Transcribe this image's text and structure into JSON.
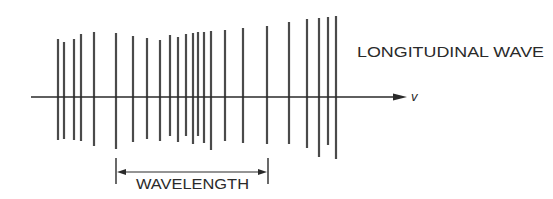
{
  "title": "LONGITUDINAL WAVE",
  "velocity_label": "v",
  "wavelength_label": "WAVELENGTH",
  "colors": {
    "line": "#4a4a4a",
    "axis": "#2a2a2a",
    "text": "#2a2a2a",
    "background": "#ffffff"
  },
  "axis": {
    "x1": 31,
    "x2": 407,
    "y": 97
  },
  "wavelength_bracket": {
    "x1": 116,
    "x2": 268,
    "y": 172,
    "tick_top": 158,
    "tick_bottom": 184
  },
  "compression_lines": [
    {
      "x": 58,
      "top": 39,
      "bottom": 140
    },
    {
      "x": 64,
      "top": 42,
      "bottom": 139
    },
    {
      "x": 74,
      "top": 39,
      "bottom": 140
    },
    {
      "x": 81,
      "top": 34,
      "bottom": 141
    },
    {
      "x": 94,
      "top": 32,
      "bottom": 146
    },
    {
      "x": 116,
      "top": 33,
      "bottom": 149
    },
    {
      "x": 133,
      "top": 36,
      "bottom": 142
    },
    {
      "x": 147,
      "top": 38,
      "bottom": 139
    },
    {
      "x": 160,
      "top": 40,
      "bottom": 141
    },
    {
      "x": 170,
      "top": 35,
      "bottom": 136
    },
    {
      "x": 178,
      "top": 37,
      "bottom": 142
    },
    {
      "x": 186,
      "top": 34,
      "bottom": 136
    },
    {
      "x": 193,
      "top": 33,
      "bottom": 144
    },
    {
      "x": 198,
      "top": 32,
      "bottom": 136
    },
    {
      "x": 204,
      "top": 32,
      "bottom": 143
    },
    {
      "x": 211,
      "top": 31,
      "bottom": 150
    },
    {
      "x": 225,
      "top": 30,
      "bottom": 141
    },
    {
      "x": 243,
      "top": 28,
      "bottom": 143
    },
    {
      "x": 267,
      "top": 26,
      "bottom": 144
    },
    {
      "x": 289,
      "top": 22,
      "bottom": 144
    },
    {
      "x": 307,
      "top": 19,
      "bottom": 148
    },
    {
      "x": 319,
      "top": 18,
      "bottom": 157
    },
    {
      "x": 328,
      "top": 17,
      "bottom": 145
    },
    {
      "x": 336,
      "top": 16,
      "bottom": 159
    }
  ]
}
